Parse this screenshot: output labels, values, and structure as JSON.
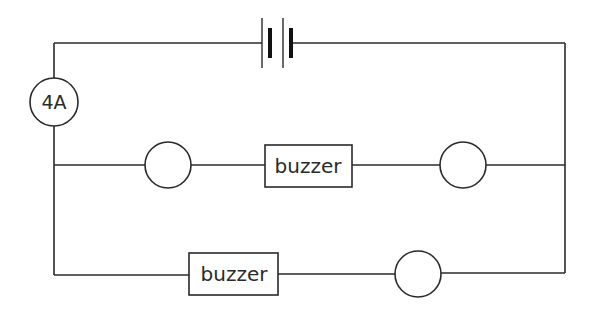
{
  "diagram": {
    "type": "circuit",
    "background": "#ffffff",
    "stroke_color": "#2a2a2a",
    "battery": {
      "cells": 2,
      "position": "top-center"
    },
    "ammeter": {
      "label": "4A",
      "position": "left-top"
    },
    "branches": [
      {
        "name": "middle-branch",
        "components": [
          {
            "type": "lamp",
            "label": ""
          },
          {
            "type": "buzzer",
            "label": "buzzer"
          },
          {
            "type": "lamp",
            "label": ""
          }
        ]
      },
      {
        "name": "bottom-branch",
        "components": [
          {
            "type": "buzzer",
            "label": "buzzer"
          },
          {
            "type": "lamp",
            "label": ""
          }
        ]
      }
    ]
  }
}
